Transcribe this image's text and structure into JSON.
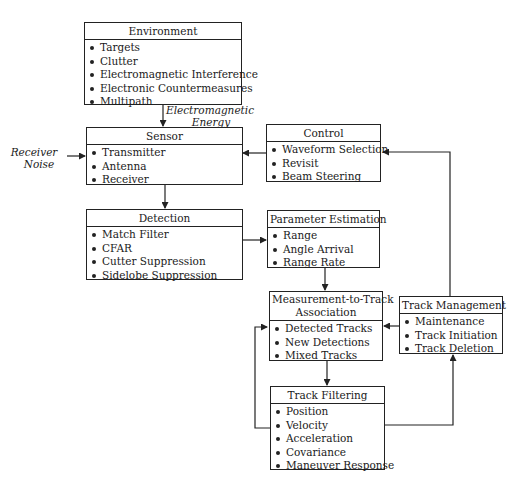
{
  "diagram": {
    "type": "block-flow"
  },
  "boxes": {
    "environment": {
      "title": "Environment",
      "items": [
        "Targets",
        "Clutter",
        "Electromagnetic Interference",
        "Electronic Countermeasures",
        "Multipath"
      ]
    },
    "sensor": {
      "title": "Sensor",
      "items": [
        "Transmitter",
        "Antenna",
        "Receiver"
      ]
    },
    "control": {
      "title": "Control",
      "items": [
        "Waveform Selection",
        "Revisit",
        "Beam Steering"
      ]
    },
    "detection": {
      "title": "Detection",
      "items": [
        "Match Filter",
        "CFAR",
        "Cutter Suppression",
        "Sidelobe Suppression"
      ]
    },
    "parameter_estimation": {
      "title": "Parameter Estimation",
      "items": [
        "Range",
        "Angle Arrival",
        "Range Rate"
      ]
    },
    "association": {
      "title_line1": "Measurement-to-Track",
      "title_line2": "Association",
      "items": [
        "Detected Tracks",
        "New Detections",
        "Mixed Tracks"
      ]
    },
    "track_management": {
      "title": "Track Management",
      "items": [
        "Maintenance",
        "Track Initiation",
        "Track Deletion"
      ]
    },
    "track_filtering": {
      "title": "Track Filtering",
      "items": [
        "Position",
        "Velocity",
        "Acceleration",
        "Covariance",
        "Maneuver Response"
      ]
    }
  },
  "labels": {
    "em_energy_line1": "Electromagnetic",
    "em_energy_line2": "Energy",
    "receiver_noise_line1": "Receiver",
    "receiver_noise_line2": "Noise"
  },
  "edges": [
    {
      "from": "environment",
      "to": "sensor",
      "label": "Electromagnetic Energy"
    },
    {
      "from": "receiver_noise",
      "to": "sensor"
    },
    {
      "from": "control",
      "to": "sensor"
    },
    {
      "from": "sensor",
      "to": "detection"
    },
    {
      "from": "detection",
      "to": "parameter_estimation"
    },
    {
      "from": "parameter_estimation",
      "to": "association"
    },
    {
      "from": "association",
      "to": "track_filtering"
    },
    {
      "from": "track_filtering",
      "to": "association"
    },
    {
      "from": "track_filtering",
      "to": "track_management"
    },
    {
      "from": "track_management",
      "to": "association"
    },
    {
      "from": "track_management",
      "to": "control"
    }
  ]
}
